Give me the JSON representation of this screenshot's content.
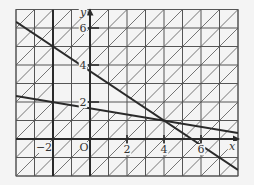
{
  "diagram": {
    "type": "linear-inequality-region",
    "grid": {
      "x_min": -4,
      "x_max": 8,
      "y_min": -2,
      "y_max": 7,
      "step": 1,
      "hatched_outside_region": true,
      "hatch_direction": "bottom-left to top-right"
    },
    "axes": {
      "x_label": "x",
      "y_label": "y",
      "origin_label": "O",
      "x_ticks": [
        {
          "value": -2,
          "label": "−2"
        },
        {
          "value": 2,
          "label": "2"
        },
        {
          "value": 4,
          "label": "4"
        },
        {
          "value": 6,
          "label": "6"
        }
      ],
      "y_ticks": [
        {
          "value": 2,
          "label": "2"
        },
        {
          "value": 4,
          "label": "4"
        },
        {
          "value": 6,
          "label": "6"
        }
      ]
    },
    "boundary_lines": [
      {
        "name": "line-1",
        "equation": "2x + 3y = 11",
        "from": [
          -4,
          6.33
        ],
        "to": [
          8,
          -1.67
        ]
      },
      {
        "name": "line-2",
        "equation": "x + 6y = 10",
        "from": [
          -4,
          2.33
        ],
        "to": [
          8,
          0.33
        ]
      },
      {
        "name": "line-x-neg2",
        "equation": "x = -2",
        "from": [
          -2,
          -2
        ],
        "to": [
          -2,
          7
        ]
      }
    ],
    "unshaded_region_vertices": [
      [
        -2,
        5
      ],
      [
        -2,
        2
      ],
      [
        4,
        1
      ]
    ],
    "colors": {
      "background": "#f4f4f4",
      "grid": "#555555",
      "hatch": "#666666",
      "lines": "#2a2a2a",
      "region": "#f4f4f4"
    }
  }
}
